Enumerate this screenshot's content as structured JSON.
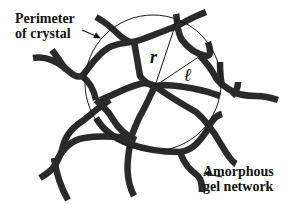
{
  "figure": {
    "colors": {
      "background": "#ffffff",
      "fiber": "#2a2a2a",
      "line": "#1a1a1a",
      "text": "#111111"
    }
  },
  "labels": {
    "perimeter": {
      "line1": "Perimeter",
      "line2": "of crystal"
    },
    "network": {
      "line1": "Amorphous",
      "line2": "gel network"
    }
  },
  "variables": {
    "radius": "r",
    "length": "ℓ"
  },
  "geometry": {
    "circle": {
      "cx": 153,
      "cy": 83,
      "r": 68
    },
    "radius_line": {
      "x1": 155,
      "y1": 86,
      "x2": 177,
      "y2": 20
    },
    "length_line": {
      "x1": 155,
      "y1": 86,
      "x2": 200,
      "y2": 56
    }
  }
}
